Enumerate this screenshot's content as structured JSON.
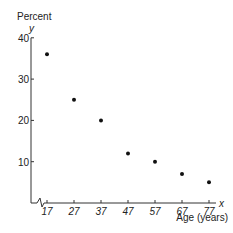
{
  "chart_data": {
    "type": "scatter",
    "title": "",
    "ylabel_top": "Percent",
    "ylabel_var": "y",
    "xlabel": "Age (years)",
    "xlabel_var": "x",
    "x_ticks": [
      17,
      27,
      37,
      47,
      57,
      67,
      77
    ],
    "y_ticks": [
      10,
      20,
      30,
      40
    ],
    "ylim": [
      0,
      40
    ],
    "x_axis_break": true,
    "grid": false,
    "points": [
      {
        "x": 17,
        "y": 36
      },
      {
        "x": 27,
        "y": 25
      },
      {
        "x": 37,
        "y": 20
      },
      {
        "x": 47,
        "y": 12
      },
      {
        "x": 57,
        "y": 10
      },
      {
        "x": 67,
        "y": 7
      },
      {
        "x": 77,
        "y": 5
      }
    ],
    "colors": {
      "axis": "#333333",
      "point": "#111111",
      "text": "#222222"
    }
  }
}
